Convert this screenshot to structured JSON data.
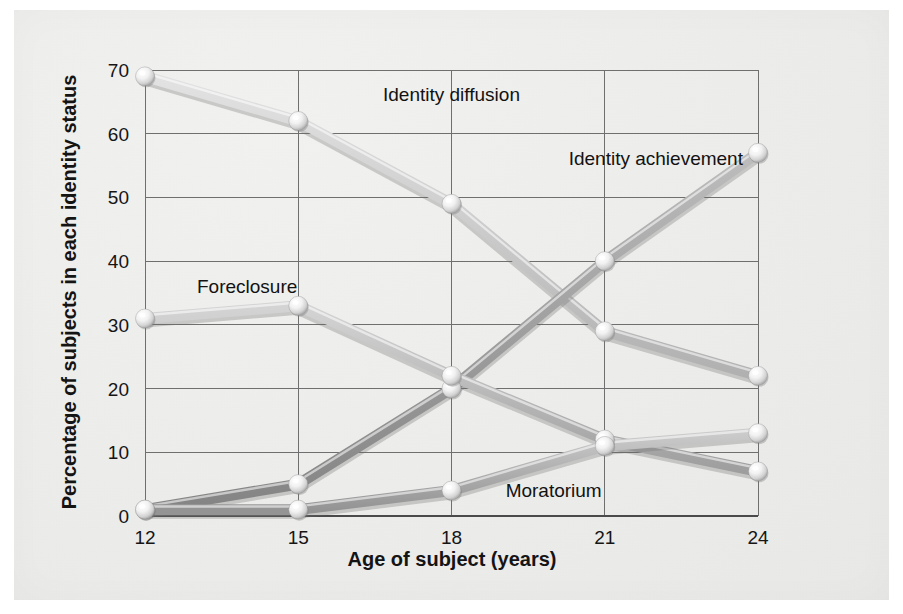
{
  "chart_data": {
    "type": "line",
    "title": "",
    "xlabel": "Age of subject (years)",
    "ylabel": "Percentage of subjects in each identity status",
    "x": [
      12,
      15,
      18,
      21,
      24
    ],
    "xtick_labels": [
      "12",
      "15",
      "18",
      "21",
      "24"
    ],
    "ytick_labels": [
      "0",
      "10",
      "20",
      "30",
      "40",
      "50",
      "60",
      "70"
    ],
    "yticks": [
      0,
      10,
      20,
      30,
      40,
      50,
      60,
      70
    ],
    "xlim": [
      12,
      24
    ],
    "ylim": [
      0,
      70
    ],
    "grid": true,
    "legend": "inline-labels",
    "marker": "sphere",
    "series": [
      {
        "name": "Identity diffusion",
        "values": [
          69,
          62,
          49,
          29,
          22
        ],
        "color": "#c9c9c9",
        "label_x": 18,
        "label_y": 66
      },
      {
        "name": "Identity achievement",
        "values": [
          1,
          5,
          20,
          40,
          57
        ],
        "color": "#9a9a9a",
        "label_x": 22,
        "label_y": 56
      },
      {
        "name": "Foreclosure",
        "values": [
          31,
          33,
          22,
          12,
          7
        ],
        "color": "#b4b4b4",
        "label_x": 14,
        "label_y": 36
      },
      {
        "name": "Moratorium",
        "values": [
          1,
          1,
          4,
          11,
          13
        ],
        "color": "#ababab",
        "label_x": 20,
        "label_y": 4
      }
    ]
  },
  "axes": {
    "x_title": "Age of subject (years)",
    "y_title": "Percentage of subjects in each identity status"
  },
  "ticks": {
    "x": [
      "12",
      "15",
      "18",
      "21",
      "24"
    ],
    "y": [
      "0",
      "10",
      "20",
      "30",
      "40",
      "50",
      "60",
      "70"
    ]
  },
  "series_labels": {
    "identity_diffusion": "Identity diffusion",
    "identity_achievement": "Identity achievement",
    "foreclosure": "Foreclosure",
    "moratorium": "Moratorium"
  },
  "colors": {
    "identity_diffusion": "#c9c9c9",
    "identity_achievement": "#9a9a9a",
    "foreclosure": "#b4b4b4",
    "moratorium": "#ababab",
    "grid": "#6f6f6f",
    "text": "#141414",
    "paper": "#eeeeec"
  }
}
